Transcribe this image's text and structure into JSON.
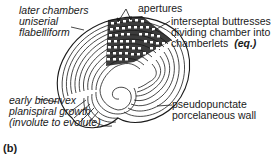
{
  "figure": {
    "panel_label": "(b)",
    "labels": {
      "later_chambers": [
        "later chambers",
        "uniserial",
        "flabelliform"
      ],
      "apertures": "apertures",
      "interseptal": [
        "interseptal buttresses",
        "dividing chamber into",
        "chamberlets"
      ],
      "interseptal_tag": "(eq.)",
      "early_growth": [
        "early biconvex",
        "planispiral growth",
        "(involute to evolute)"
      ],
      "wall": [
        "pseudopunctate",
        "porcelaneous wall"
      ]
    },
    "colors": {
      "ink": "#1a1a1a",
      "background": "#ffffff"
    }
  }
}
